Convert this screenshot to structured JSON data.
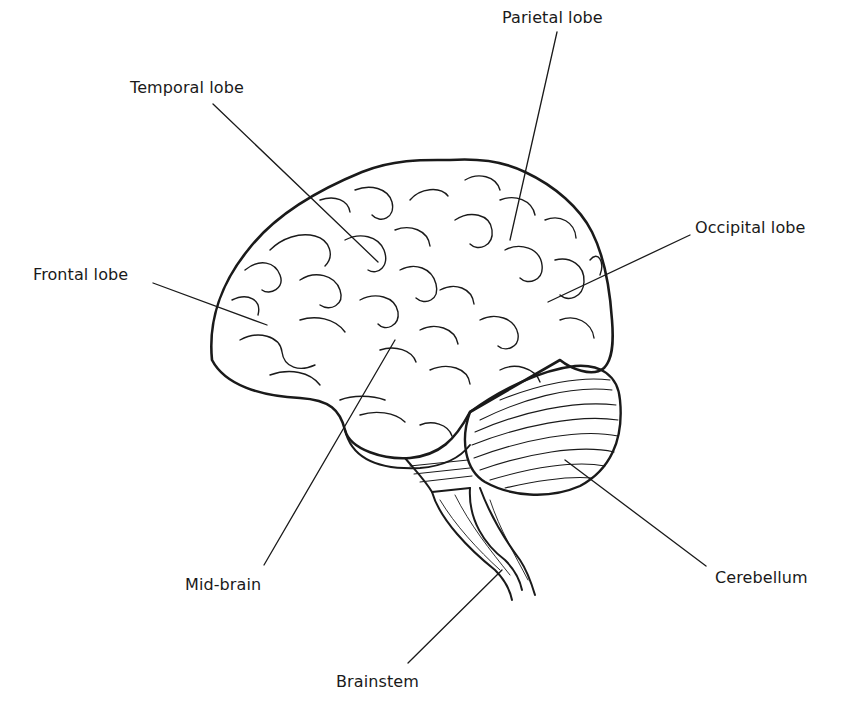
{
  "diagram": {
    "labels": [
      {
        "id": "temporal-lobe",
        "text": "Temporal lobe",
        "x": 130,
        "y": 78,
        "line": [
          213,
          104,
          378,
          262
        ]
      },
      {
        "id": "parietal-lobe",
        "text": "Parietal lobe",
        "x": 502,
        "y": 8,
        "line": [
          557,
          32,
          510,
          240
        ]
      },
      {
        "id": "frontal-lobe",
        "text": "Frontal lobe",
        "x": 33,
        "y": 265,
        "line": [
          153,
          283,
          267,
          325
        ]
      },
      {
        "id": "occipital-lobe",
        "text": "Occipital lobe",
        "x": 695,
        "y": 218,
        "line": [
          690,
          235,
          548,
          302
        ]
      },
      {
        "id": "mid-brain",
        "text": "Mid-brain",
        "x": 185,
        "y": 575,
        "line": [
          264,
          565,
          395,
          340
        ]
      },
      {
        "id": "cerebellum",
        "text": "Cerebellum",
        "x": 715,
        "y": 568,
        "line": [
          706,
          566,
          565,
          460
        ]
      },
      {
        "id": "brainstem",
        "text": "Brainstem",
        "x": 336,
        "y": 672,
        "line": [
          408,
          663,
          502,
          570
        ]
      }
    ],
    "colors": {
      "ink": "#1a1a1a",
      "background": "#ffffff",
      "bleed_through": "#ececec"
    }
  }
}
